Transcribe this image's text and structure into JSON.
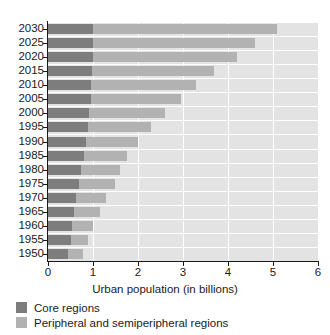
{
  "chart_data": {
    "type": "bar",
    "orientation": "horizontal",
    "stacked": true,
    "title": "",
    "xlabel": "Urban population (in billions)",
    "ylabel": "",
    "xlim": [
      0,
      6
    ],
    "xticks": [
      "0",
      "1",
      "2",
      "3",
      "4",
      "5",
      "6"
    ],
    "grid": true,
    "legend_position": "below",
    "categories": [
      "2030",
      "2025",
      "2020",
      "2015",
      "2010",
      "2005",
      "2000",
      "1995",
      "1990",
      "1985",
      "1980",
      "1975",
      "1970",
      "1965",
      "1960",
      "1955",
      "1950"
    ],
    "series": [
      {
        "name": "Core regions",
        "color": "#7d7d7d",
        "values": [
          1.01,
          1.0,
          0.99,
          0.98,
          0.96,
          0.95,
          0.92,
          0.89,
          0.85,
          0.8,
          0.74,
          0.68,
          0.63,
          0.58,
          0.54,
          0.5,
          0.45
        ]
      },
      {
        "name": "Peripheral and semiperipheral regions",
        "color": "#b2b2b2",
        "values": [
          4.09,
          3.6,
          3.21,
          2.72,
          2.34,
          2.0,
          1.68,
          1.41,
          1.15,
          0.95,
          0.86,
          0.82,
          0.67,
          0.57,
          0.46,
          0.38,
          0.33
        ]
      }
    ],
    "totals": [
      5.1,
      4.6,
      4.2,
      3.7,
      3.3,
      2.95,
      2.6,
      2.3,
      2.0,
      1.75,
      1.6,
      1.5,
      1.3,
      1.15,
      1.0,
      0.88,
      0.78
    ]
  },
  "legend": {
    "items": [
      {
        "label": "Core regions",
        "color": "#7d7d7d"
      },
      {
        "label": "Peripheral and semiperipheral regions",
        "color": "#b2b2b2"
      }
    ]
  }
}
